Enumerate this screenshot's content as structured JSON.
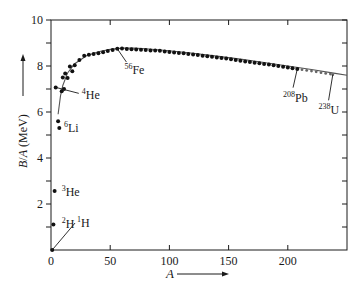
{
  "chart_data": {
    "type": "scatter",
    "title": "",
    "xlabel": "A",
    "ylabel": "B/A (MeV)",
    "xlim": [
      0,
      250
    ],
    "ylim": [
      0,
      10
    ],
    "x_ticks": [
      0,
      50,
      100,
      150,
      200
    ],
    "y_ticks": [
      2,
      4,
      6,
      8,
      10
    ],
    "y_minor_ticks": [
      1,
      3,
      5,
      7,
      9
    ],
    "grid": false,
    "legend": null,
    "series": [
      {
        "name": "measured nuclides",
        "style": "dots",
        "points": [
          [
            1,
            0.0
          ],
          [
            2,
            1.11
          ],
          [
            3,
            2.57
          ],
          [
            4,
            7.07
          ],
          [
            6,
            5.6
          ],
          [
            7,
            5.3
          ],
          [
            9,
            6.9
          ],
          [
            10,
            7.5
          ],
          [
            11,
            7.0
          ],
          [
            12,
            7.68
          ],
          [
            14,
            7.48
          ],
          [
            16,
            7.98
          ],
          [
            18,
            7.77
          ],
          [
            20,
            8.03
          ],
          [
            24,
            8.26
          ],
          [
            28,
            8.45
          ],
          [
            32,
            8.49
          ],
          [
            36,
            8.52
          ],
          [
            40,
            8.55
          ],
          [
            44,
            8.6
          ],
          [
            48,
            8.65
          ],
          [
            52,
            8.7
          ],
          [
            56,
            8.75
          ],
          [
            60,
            8.76
          ],
          [
            64,
            8.74
          ],
          [
            68,
            8.73
          ],
          [
            72,
            8.72
          ],
          [
            76,
            8.71
          ],
          [
            80,
            8.7
          ],
          [
            84,
            8.68
          ],
          [
            88,
            8.67
          ],
          [
            92,
            8.66
          ],
          [
            96,
            8.63
          ],
          [
            100,
            8.61
          ],
          [
            104,
            8.59
          ],
          [
            108,
            8.57
          ],
          [
            112,
            8.55
          ],
          [
            116,
            8.52
          ],
          [
            120,
            8.5
          ],
          [
            124,
            8.48
          ],
          [
            128,
            8.45
          ],
          [
            132,
            8.42
          ],
          [
            136,
            8.4
          ],
          [
            140,
            8.37
          ],
          [
            144,
            8.35
          ],
          [
            148,
            8.32
          ],
          [
            152,
            8.29
          ],
          [
            156,
            8.26
          ],
          [
            160,
            8.23
          ],
          [
            164,
            8.2
          ],
          [
            168,
            8.17
          ],
          [
            172,
            8.14
          ],
          [
            176,
            8.12
          ],
          [
            180,
            8.09
          ],
          [
            184,
            8.06
          ],
          [
            188,
            8.03
          ],
          [
            192,
            8.0
          ],
          [
            196,
            7.97
          ],
          [
            200,
            7.93
          ],
          [
            204,
            7.9
          ],
          [
            208,
            7.87
          ]
        ]
      },
      {
        "name": "heavy nuclides",
        "style": "small-dots",
        "points": [
          [
            212,
            7.84
          ],
          [
            216,
            7.81
          ],
          [
            220,
            7.78
          ],
          [
            224,
            7.75
          ],
          [
            228,
            7.71
          ],
          [
            232,
            7.68
          ],
          [
            236,
            7.65
          ],
          [
            238,
            7.62
          ]
        ]
      },
      {
        "name": "semi-empirical fit",
        "style": "line",
        "points": [
          [
            6,
            5.9
          ],
          [
            8,
            6.7
          ],
          [
            10,
            7.15
          ],
          [
            14,
            7.7
          ],
          [
            20,
            8.1
          ],
          [
            30,
            8.45
          ],
          [
            40,
            8.62
          ],
          [
            50,
            8.72
          ],
          [
            60,
            8.78
          ],
          [
            70,
            8.78
          ],
          [
            80,
            8.75
          ],
          [
            100,
            8.66
          ],
          [
            120,
            8.55
          ],
          [
            140,
            8.43
          ],
          [
            160,
            8.3
          ],
          [
            180,
            8.15
          ],
          [
            200,
            8.0
          ],
          [
            220,
            7.85
          ],
          [
            240,
            7.68
          ],
          [
            250,
            7.6
          ]
        ]
      }
    ],
    "annotations": [
      {
        "label_sup": "1",
        "label": "H",
        "point": [
          1,
          0.0
        ],
        "text_pos": [
          22,
          1.0
        ]
      },
      {
        "label_sup": "2",
        "label": "H",
        "point": [
          2,
          1.11
        ],
        "text_pos": [
          9,
          0.95
        ]
      },
      {
        "label_sup": "3",
        "label": "He",
        "point": [
          3,
          2.57
        ],
        "text_pos": [
          9,
          2.35
        ]
      },
      {
        "label_sup": "4",
        "label": "He",
        "point": [
          4,
          7.07
        ],
        "text_pos": [
          26,
          6.55
        ]
      },
      {
        "label_sup": "6",
        "label": "Li",
        "point": [
          7,
          5.3
        ],
        "text_pos": [
          11,
          5.15
        ]
      },
      {
        "label_sup": "56",
        "label": "Fe",
        "point": [
          56,
          8.75
        ],
        "text_pos": [
          62,
          7.65
        ]
      },
      {
        "label_sup": "208",
        "label": "Pb",
        "point": [
          208,
          7.87
        ],
        "text_pos": [
          196,
          6.45
        ]
      },
      {
        "label_sup": "238",
        "label": "U",
        "point": [
          238,
          7.62
        ],
        "text_pos": [
          226,
          5.9
        ]
      }
    ]
  },
  "axes": {
    "x_label": "A",
    "y_label": "B/A (MeV)"
  }
}
